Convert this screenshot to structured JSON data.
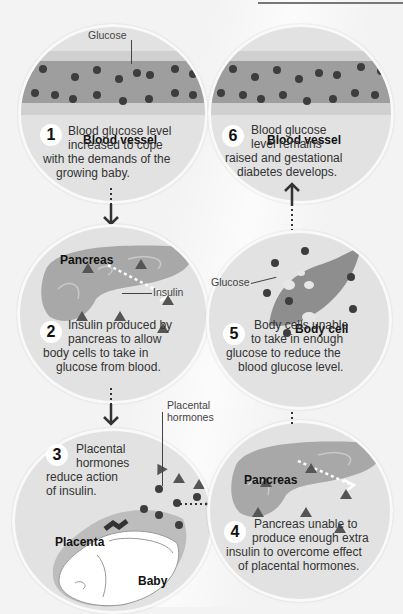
{
  "diagram": {
    "steps": [
      {
        "number": "1",
        "heading": "Blood vessel",
        "label": "Glucose",
        "text": [
          "Blood glucose level",
          "increased to cope",
          "with the demands of the",
          "growing baby."
        ]
      },
      {
        "number": "2",
        "heading": "Pancreas",
        "label": "Insulin",
        "text": [
          "Insulin produced by",
          "pancreas to allow",
          "body cells to take in",
          "glucose from blood."
        ]
      },
      {
        "number": "3",
        "heading": "Placenta",
        "label": "Placental hormones",
        "label_lines": [
          "Placental",
          "hormones"
        ],
        "sublabel": "Baby",
        "text": [
          "Placental",
          "hormones",
          "reduce action",
          "of insulin."
        ]
      },
      {
        "number": "4",
        "heading": "Pancreas",
        "text": [
          "Pancreas unable to",
          "produce enough extra",
          "insulin to overcome effect",
          "of placental hormones."
        ]
      },
      {
        "number": "5",
        "heading": "Body cell",
        "label": "Glucose",
        "text": [
          "Body cells unable",
          "to take in enough",
          "glucose to reduce the",
          "blood glucose level."
        ]
      },
      {
        "number": "6",
        "heading": "Blood vessel",
        "text": [
          "Blood glucose",
          "level remains",
          "raised and gestational",
          "diabetes develops."
        ]
      }
    ],
    "flow": [
      "1 → 2 (down)",
      "2 → 3 (down)",
      "3 → 4 (right)",
      "4 → 5 (up)",
      "5 → 6 (up)"
    ],
    "colors": {
      "background": "#f3f3f3",
      "circle": "#e2e2e2",
      "vessel_outer": "#d0d0d0",
      "vessel_inner": "#9e9e9e",
      "glucose_dot": "#3d3d3d",
      "organ": "#a8a8a8",
      "hormone_triangle": "#555555"
    }
  }
}
